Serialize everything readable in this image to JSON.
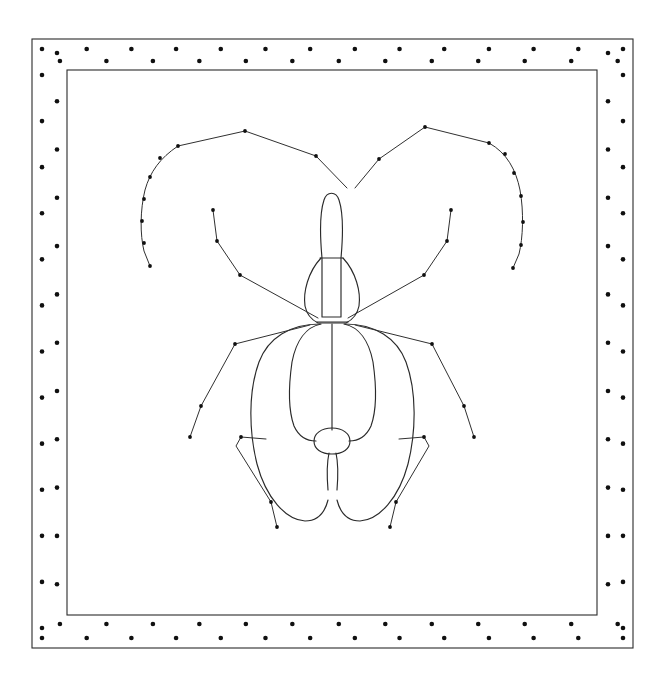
{
  "plate": {
    "title": "Insect dorsal line drawing",
    "subject": "beetle",
    "view": "dorsal",
    "width": 666,
    "height": 688,
    "background_color": "#ffffff",
    "ink_color": "#2a2a2a",
    "dot_color": "#101010"
  },
  "frame": {
    "name": "double-rule-dotted-border",
    "outer_rect": {
      "x": 32,
      "y": 39,
      "width": 601,
      "height": 609
    },
    "inner_rect": {
      "x": 67,
      "y": 70,
      "width": 530,
      "height": 545
    },
    "stroke_color": "#2b2b2b",
    "stroke_width": 1.1,
    "dot_rows": 2,
    "dot_radius": 2.3,
    "dot_spacing_top": 43,
    "dot_spacing_side": 42,
    "top_outer_row_y": 49,
    "top_inner_row_y": 61,
    "bottom_outer_row_y": 638,
    "bottom_inner_row_y": 624,
    "left_outer_col_x": 42,
    "left_inner_col_x": 57,
    "right_outer_col_x": 623,
    "right_inner_col_x": 608,
    "dot_count_top_outer": 14,
    "dot_count_top_inner": 13,
    "dot_count_bottom_outer": 14,
    "dot_count_bottom_inner": 13,
    "dot_count_left_outer": 13,
    "dot_count_left_inner": 12,
    "dot_count_right_outer": 13,
    "dot_count_right_inner": 12
  },
  "insect": {
    "parts": [
      {
        "name": "head",
        "label": "head-capsule"
      },
      {
        "name": "pronotum",
        "label": "pronotum-thorax"
      },
      {
        "name": "elytron-left",
        "label": "left-elytron"
      },
      {
        "name": "elytron-right",
        "label": "right-elytron"
      },
      {
        "name": "elytral-suture",
        "label": "central-suture"
      },
      {
        "name": "scutellum",
        "label": "scutellum-oval"
      },
      {
        "name": "tail",
        "label": "abdominal-tip"
      },
      {
        "name": "antenna-left",
        "label": "left-antenna"
      },
      {
        "name": "antenna-right",
        "label": "right-antenna"
      },
      {
        "name": "foreleg-left",
        "label": "left-foreleg"
      },
      {
        "name": "foreleg-right",
        "label": "right-foreleg"
      },
      {
        "name": "midleg-left",
        "label": "left-midleg"
      },
      {
        "name": "midleg-right",
        "label": "right-midleg"
      },
      {
        "name": "hindleg-left",
        "label": "left-hindleg"
      },
      {
        "name": "hindleg-right",
        "label": "right-hindleg"
      }
    ],
    "geometry": {
      "head": "M 322 317 L 322 258 C 320 236 320 212 324 200 C 327 191 336 191 339 200 C 343 212 343 236 341 258 L 341 317 Z",
      "head_neck_line": "M 320 258 L 343 258",
      "pronotum": "M 321 258 C 308 272 303 292 305 306 C 307 316 312 320 318 323 L 346 323 C 352 320 357 316 359 306 C 361 292 356 272 343 258",
      "pronotum_base": "M 317 322 L 348 322",
      "elytron_left_outer": "M 320 324 C 290 324 268 338 259 362 C 248 392 249 432 257 464 C 266 498 286 520 305 521 C 318 521 325 512 328 500",
      "elytron_right_outer": "M 345 324 C 375 324 397 338 406 362 C 417 392 416 432 408 464 C 399 498 379 520 360 521 C 347 521 340 512 337 500",
      "elytron_left_inner": "M 321 324 C 306 327 296 341 292 362 C 288 390 289 412 294 426 C 299 437 307 441 316 441",
      "elytron_right_inner": "M 344 324 C 359 327 369 341 373 362 C 377 390 376 412 371 426 C 366 437 358 441 349 441",
      "suture": "M 332 324 L 332 430",
      "scutellum": "M 332 428 C 321 428 314 434 314 441 C 314 449 321 454 332 454 C 343 454 350 449 350 441 C 350 434 343 428 332 428 Z",
      "tail_left": "M 329 453 C 327 462 327 478 328 490",
      "tail_right": "M 336 453 C 338 462 338 478 337 490",
      "antenna_left": "M 347 188 L 316 156 L 245 131 L 178 146 C 160 158 150 172 145 190 C 140 210 140 235 144 251 L 150 266",
      "antenna_right": "M 355 188 L 379 159 L 425 127 L 489 143 C 507 153 516 170 520 190 C 524 212 523 238 519 254 L 513 268",
      "foreleg_left": "M 318 318 L 240 275 L 217 241 L 213 210",
      "foreleg_right": "M 348 318 L 424 275 L 447 241 L 451 210",
      "midleg_left": "M 310 325 L 235 344 L 201 406 L 190 437",
      "midleg_right": "M 355 325 L 432 344 L 464 406 L 474 437",
      "hindleg_left": "M 266 439 L 241 437 L 236 446 L 271 502 L 277 527",
      "hindleg_right": "M 399 439 L 424 437 L 429 446 L 396 502 L 390 527"
    },
    "joint_dots": [
      {
        "part": "antenna-left",
        "x": 316,
        "y": 156
      },
      {
        "part": "antenna-left",
        "x": 245,
        "y": 131
      },
      {
        "part": "antenna-left",
        "x": 178,
        "y": 146
      },
      {
        "part": "antenna-left",
        "x": 160,
        "y": 158
      },
      {
        "part": "antenna-left",
        "x": 150,
        "y": 177
      },
      {
        "part": "antenna-left",
        "x": 144,
        "y": 199
      },
      {
        "part": "antenna-left",
        "x": 142,
        "y": 221
      },
      {
        "part": "antenna-left",
        "x": 144,
        "y": 243
      },
      {
        "part": "antenna-left",
        "x": 150,
        "y": 266
      },
      {
        "part": "antenna-right",
        "x": 379,
        "y": 159
      },
      {
        "part": "antenna-right",
        "x": 425,
        "y": 127
      },
      {
        "part": "antenna-right",
        "x": 489,
        "y": 143
      },
      {
        "part": "antenna-right",
        "x": 505,
        "y": 154
      },
      {
        "part": "antenna-right",
        "x": 514,
        "y": 173
      },
      {
        "part": "antenna-right",
        "x": 521,
        "y": 196
      },
      {
        "part": "antenna-right",
        "x": 523,
        "y": 222
      },
      {
        "part": "antenna-right",
        "x": 521,
        "y": 245
      },
      {
        "part": "antenna-right",
        "x": 513,
        "y": 268
      },
      {
        "part": "foreleg-left",
        "x": 240,
        "y": 275
      },
      {
        "part": "foreleg-left",
        "x": 217,
        "y": 241
      },
      {
        "part": "foreleg-left",
        "x": 213,
        "y": 210
      },
      {
        "part": "foreleg-right",
        "x": 424,
        "y": 275
      },
      {
        "part": "foreleg-right",
        "x": 447,
        "y": 241
      },
      {
        "part": "foreleg-right",
        "x": 451,
        "y": 210
      },
      {
        "part": "midleg-left",
        "x": 235,
        "y": 344
      },
      {
        "part": "midleg-left",
        "x": 201,
        "y": 406
      },
      {
        "part": "midleg-left",
        "x": 190,
        "y": 437
      },
      {
        "part": "midleg-right",
        "x": 432,
        "y": 344
      },
      {
        "part": "midleg-right",
        "x": 464,
        "y": 406
      },
      {
        "part": "midleg-right",
        "x": 474,
        "y": 437
      },
      {
        "part": "hindleg-left",
        "x": 241,
        "y": 437
      },
      {
        "part": "hindleg-left",
        "x": 271,
        "y": 502
      },
      {
        "part": "hindleg-left",
        "x": 277,
        "y": 527
      },
      {
        "part": "hindleg-right",
        "x": 424,
        "y": 437
      },
      {
        "part": "hindleg-right",
        "x": 396,
        "y": 502
      },
      {
        "part": "hindleg-right",
        "x": 390,
        "y": 527
      }
    ]
  }
}
